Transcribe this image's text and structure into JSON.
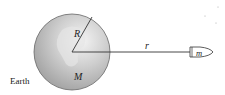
{
  "diagram": {
    "labels": {
      "earth": "Earth",
      "radius": "R",
      "mass_earth": "M",
      "distance": "r",
      "satellite_mass": "m"
    },
    "colors": {
      "sphere_light": "#f2f2f2",
      "sphere_mid": "#c8c8c8",
      "sphere_dark": "#9a9a9a",
      "line": "#333333"
    }
  }
}
